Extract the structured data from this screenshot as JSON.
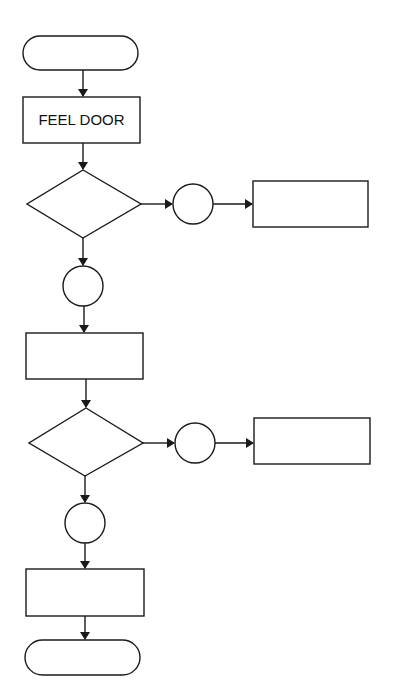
{
  "diagram": {
    "type": "flowchart",
    "nodes": [
      {
        "id": "start",
        "shape": "terminal",
        "label": ""
      },
      {
        "id": "feel_door",
        "shape": "process",
        "label": "FEEL DOOR"
      },
      {
        "id": "decision_1",
        "shape": "decision",
        "label": ""
      },
      {
        "id": "connector_1a",
        "shape": "connector",
        "label": ""
      },
      {
        "id": "process_1b",
        "shape": "process",
        "label": ""
      },
      {
        "id": "connector_1c",
        "shape": "connector",
        "label": ""
      },
      {
        "id": "process_2",
        "shape": "process",
        "label": ""
      },
      {
        "id": "decision_2",
        "shape": "decision",
        "label": ""
      },
      {
        "id": "connector_2a",
        "shape": "connector",
        "label": ""
      },
      {
        "id": "process_2b",
        "shape": "process",
        "label": ""
      },
      {
        "id": "connector_2c",
        "shape": "connector",
        "label": ""
      },
      {
        "id": "process_3",
        "shape": "process",
        "label": ""
      },
      {
        "id": "end",
        "shape": "terminal",
        "label": ""
      }
    ],
    "edges": [
      [
        "start",
        "feel_door"
      ],
      [
        "feel_door",
        "decision_1"
      ],
      [
        "decision_1",
        "connector_1a"
      ],
      [
        "connector_1a",
        "process_1b"
      ],
      [
        "decision_1",
        "connector_1c"
      ],
      [
        "connector_1c",
        "process_2"
      ],
      [
        "process_2",
        "decision_2"
      ],
      [
        "decision_2",
        "connector_2a"
      ],
      [
        "connector_2a",
        "process_2b"
      ],
      [
        "decision_2",
        "connector_2c"
      ],
      [
        "connector_2c",
        "process_3"
      ],
      [
        "process_3",
        "end"
      ]
    ]
  },
  "labels": {
    "feel_door": "FEEL DOOR"
  }
}
